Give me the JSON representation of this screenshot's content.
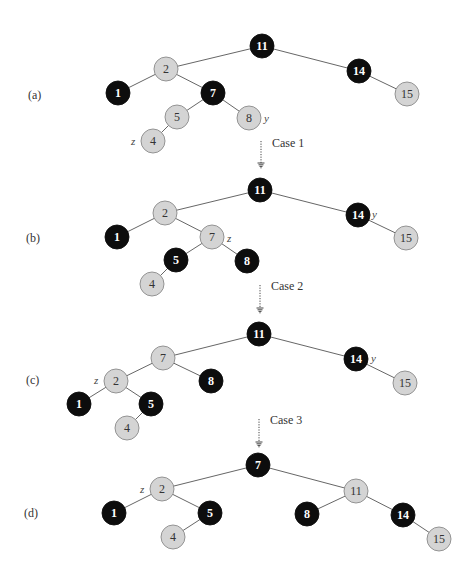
{
  "figure": {
    "colors": {
      "red_node_fill": "#d4d4d4",
      "black_node_fill": "#0d0d0d",
      "edge": "#555555"
    },
    "panels": [
      {
        "label": "(a)",
        "label_pos": [
          28,
          99
        ],
        "nodes": [
          {
            "key": "11",
            "color": "black",
            "x": 262,
            "y": 46
          },
          {
            "key": "2",
            "color": "red",
            "x": 166,
            "y": 69
          },
          {
            "key": "14",
            "color": "black",
            "x": 359,
            "y": 71
          },
          {
            "key": "1",
            "color": "black",
            "x": 118,
            "y": 93
          },
          {
            "key": "7",
            "color": "black",
            "x": 213,
            "y": 93
          },
          {
            "key": "15",
            "color": "red",
            "x": 407,
            "y": 94
          },
          {
            "key": "5",
            "color": "red",
            "x": 177,
            "y": 117
          },
          {
            "key": "8",
            "color": "red",
            "x": 249,
            "y": 118
          },
          {
            "key": "4",
            "color": "red",
            "x": 153,
            "y": 141
          }
        ],
        "edges": [
          [
            "11",
            "2"
          ],
          [
            "11",
            "14"
          ],
          [
            "2",
            "1"
          ],
          [
            "2",
            "7"
          ],
          [
            "14",
            "15"
          ],
          [
            "7",
            "5"
          ],
          [
            "7",
            "8"
          ],
          [
            "5",
            "4"
          ]
        ],
        "pointers": [
          {
            "name": "y",
            "x": 264,
            "y": 122
          },
          {
            "name": "z",
            "x": 131,
            "y": 145
          }
        ]
      },
      {
        "label": "(b)",
        "label_pos": [
          26,
          242
        ],
        "nodes": [
          {
            "key": "11",
            "color": "black",
            "x": 260,
            "y": 190
          },
          {
            "key": "2",
            "color": "red",
            "x": 165,
            "y": 213
          },
          {
            "key": "14",
            "color": "black",
            "x": 358,
            "y": 215
          },
          {
            "key": "1",
            "color": "black",
            "x": 117,
            "y": 237
          },
          {
            "key": "7",
            "color": "red",
            "x": 212,
            "y": 237
          },
          {
            "key": "15",
            "color": "red",
            "x": 406,
            "y": 238
          },
          {
            "key": "5",
            "color": "black",
            "x": 176,
            "y": 260
          },
          {
            "key": "8",
            "color": "black",
            "x": 247,
            "y": 261
          },
          {
            "key": "4",
            "color": "red",
            "x": 152,
            "y": 284
          }
        ],
        "edges": [
          [
            "11",
            "2"
          ],
          [
            "11",
            "14"
          ],
          [
            "2",
            "1"
          ],
          [
            "2",
            "7"
          ],
          [
            "14",
            "15"
          ],
          [
            "7",
            "5"
          ],
          [
            "7",
            "8"
          ],
          [
            "5",
            "4"
          ]
        ],
        "pointers": [
          {
            "name": "y",
            "x": 372,
            "y": 218
          },
          {
            "name": "z",
            "x": 227,
            "y": 242
          }
        ]
      },
      {
        "label": "(c)",
        "label_pos": [
          26,
          384
        ],
        "nodes": [
          {
            "key": "11",
            "color": "black",
            "x": 259,
            "y": 334
          },
          {
            "key": "7",
            "color": "red",
            "x": 163,
            "y": 358
          },
          {
            "key": "14",
            "color": "black",
            "x": 356,
            "y": 359
          },
          {
            "key": "2",
            "color": "red",
            "x": 116,
            "y": 381
          },
          {
            "key": "8",
            "color": "black",
            "x": 211,
            "y": 381
          },
          {
            "key": "15",
            "color": "red",
            "x": 405,
            "y": 383
          },
          {
            "key": "1",
            "color": "black",
            "x": 79,
            "y": 404
          },
          {
            "key": "5",
            "color": "black",
            "x": 151,
            "y": 404
          },
          {
            "key": "4",
            "color": "red",
            "x": 127,
            "y": 428
          }
        ],
        "edges": [
          [
            "11",
            "7"
          ],
          [
            "11",
            "14"
          ],
          [
            "7",
            "2"
          ],
          [
            "7",
            "8"
          ],
          [
            "14",
            "15"
          ],
          [
            "2",
            "1"
          ],
          [
            "2",
            "5"
          ],
          [
            "5",
            "4"
          ]
        ],
        "pointers": [
          {
            "name": "y",
            "x": 371,
            "y": 362
          },
          {
            "name": "z",
            "x": 94,
            "y": 384
          }
        ]
      },
      {
        "label": "(d)",
        "label_pos": [
          24,
          517
        ],
        "nodes": [
          {
            "key": "7",
            "color": "black",
            "x": 258,
            "y": 465
          },
          {
            "key": "2",
            "color": "red",
            "x": 162,
            "y": 489
          },
          {
            "key": "11",
            "color": "red",
            "x": 356,
            "y": 491
          },
          {
            "key": "1",
            "color": "black",
            "x": 114,
            "y": 513
          },
          {
            "key": "5",
            "color": "black",
            "x": 210,
            "y": 513
          },
          {
            "key": "8",
            "color": "black",
            "x": 307,
            "y": 514
          },
          {
            "key": "14",
            "color": "black",
            "x": 403,
            "y": 515
          },
          {
            "key": "4",
            "color": "red",
            "x": 173,
            "y": 537
          },
          {
            "key": "15",
            "color": "red",
            "x": 439,
            "y": 539
          }
        ],
        "edges": [
          [
            "7",
            "2"
          ],
          [
            "7",
            "11"
          ],
          [
            "2",
            "1"
          ],
          [
            "2",
            "5"
          ],
          [
            "11",
            "8"
          ],
          [
            "11",
            "14"
          ],
          [
            "5",
            "4"
          ],
          [
            "14",
            "15"
          ]
        ],
        "pointers": [
          {
            "name": "z",
            "x": 140,
            "y": 493
          }
        ]
      }
    ],
    "transitions": [
      {
        "label": "Case 1",
        "x": 261,
        "y1": 141,
        "y2": 168,
        "label_x": 272,
        "label_y": 147
      },
      {
        "label": "Case 2",
        "x": 260,
        "y1": 285,
        "y2": 313,
        "label_x": 271,
        "label_y": 290
      },
      {
        "label": "Case 3",
        "x": 259,
        "y1": 419,
        "y2": 447,
        "label_x": 270,
        "label_y": 424
      }
    ]
  }
}
